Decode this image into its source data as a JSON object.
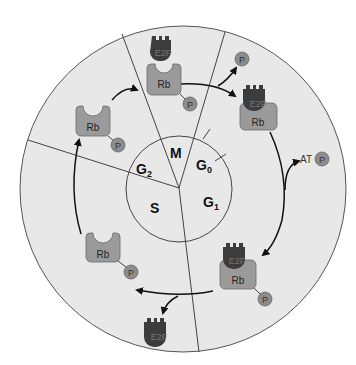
{
  "diagram": {
    "title": "",
    "phases": {
      "M": "M",
      "G0": {
        "main": "G",
        "sub": "0"
      },
      "G1": {
        "main": "G",
        "sub": "1"
      },
      "G2": {
        "main": "G",
        "sub": "2"
      },
      "S": "S"
    },
    "molecules": {
      "rb": "Rb",
      "e2f": "E2F",
      "p": "P",
      "atp_prefix": "AT"
    },
    "colors": {
      "background_disc": "#e6e6e6",
      "rb_fill": "#9a9a9a",
      "e2f_fill": "#3c3c3c",
      "p_fill": "#8c8c8c",
      "line": "#333333"
    }
  }
}
